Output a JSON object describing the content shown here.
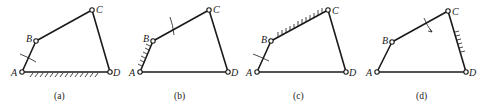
{
  "figure": {
    "panels": [
      {
        "caption": "(a)",
        "fixed_link": "AD",
        "rotation_mark_on": "AB",
        "joints": {
          "A": [
            22,
            72
          ],
          "B": [
            36,
            41
          ],
          "C": [
            92,
            10
          ],
          "D": [
            110,
            72
          ]
        },
        "labels": {
          "A": "A",
          "B": "B",
          "C": "C",
          "D": "D"
        }
      },
      {
        "caption": "(b)",
        "fixed_link": "AB",
        "rotation_mark_on": "BC",
        "joints": {
          "A": [
            140,
            72
          ],
          "B": [
            153,
            41
          ],
          "C": [
            209,
            10
          ],
          "D": [
            228,
            72
          ]
        },
        "labels": {
          "A": "A",
          "B": "B",
          "C": "C",
          "D": "D"
        }
      },
      {
        "caption": "(c)",
        "fixed_link": "BC",
        "rotation_mark_on": "AB",
        "joints": {
          "A": [
            257,
            72
          ],
          "B": [
            271,
            41
          ],
          "C": [
            328,
            10
          ],
          "D": [
            346,
            72
          ]
        },
        "labels": {
          "A": "A",
          "B": "B",
          "C": "C",
          "D": "D"
        }
      },
      {
        "caption": "(d)",
        "fixed_link": "CD",
        "rotation_mark_on": "BC",
        "joints": {
          "A": [
            377,
            72
          ],
          "B": [
            392,
            42
          ],
          "C": [
            448,
            11
          ],
          "D": [
            466,
            72
          ]
        },
        "labels": {
          "A": "A",
          "B": "B",
          "C": "C",
          "D": "D"
        }
      }
    ]
  }
}
